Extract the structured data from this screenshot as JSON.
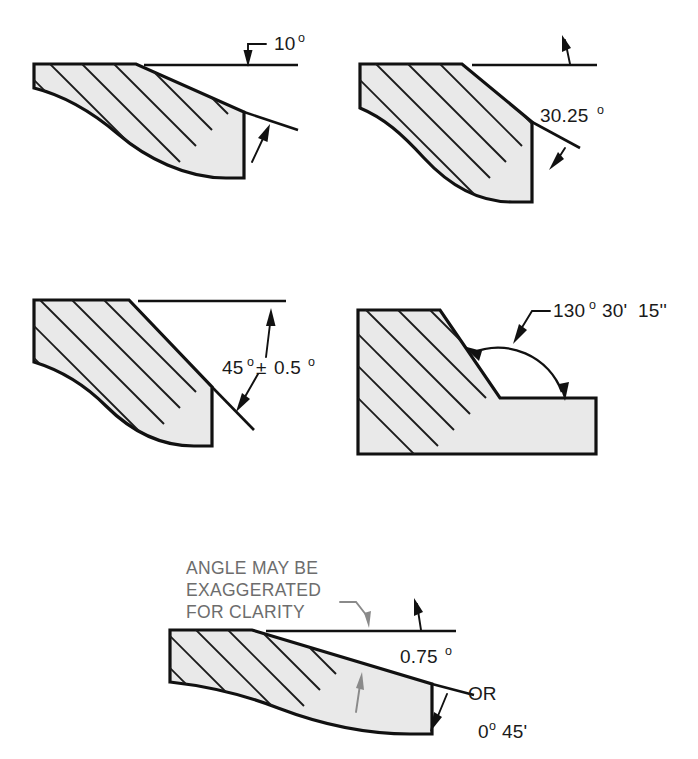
{
  "page": {
    "background_color": "#ffffff",
    "line_color": "#111111",
    "hatch_fill_color": "#e9e9e9",
    "note_color": "#6d6d6d"
  },
  "figures": [
    {
      "id": "fig-10-degrees",
      "name": "ten-degree-chamfer",
      "label": "10",
      "degree_symbol": "o",
      "label_full": "10º",
      "annotation_style": "leader-with-arrow-above-reference-line",
      "arrows": 2,
      "has_break_line": true
    },
    {
      "id": "fig-30-25-degrees",
      "name": "thirty-point-two-five-degree-chamfer",
      "label": "30.25",
      "degree_symbol": "o",
      "label_full": "30.25º",
      "annotation_style": "text-between-two-arrows",
      "arrows": 2,
      "has_break_line": true
    },
    {
      "id": "fig-45-degrees-tolerance",
      "name": "forty-five-degree-chamfer-with-tolerance",
      "label": "45",
      "degree_symbol": "o",
      "tolerance_symbol": "±",
      "tolerance_value": "0.5",
      "label_full": "45º ± 0.5º",
      "annotation_style": "text-on-leader-between-two-arrows",
      "arrows": 2,
      "has_break_line": true
    },
    {
      "id": "fig-130-degrees-arc",
      "name": "one-hundred-thirty-degree-included-angle",
      "label": "130",
      "degree_symbol": "o",
      "minutes": "30'",
      "seconds": "15''",
      "label_full": "130º 30' 15''",
      "annotation_style": "arc-dimension-with-leader",
      "arrows": 2,
      "has_break_line": false
    },
    {
      "id": "fig-075-degrees",
      "name": "point-seven-five-degree-exaggerated-angle",
      "note_lines": [
        "ANGLE MAY BE",
        "EXAGGERATED",
        "FOR CLARITY"
      ],
      "label": "0.75",
      "degree_symbol": "o",
      "label_full": "0.75º",
      "alternative_connector": "OR",
      "alternative_label": "0º 45'",
      "alternative_degrees": "0",
      "alternative_minutes": "45'",
      "annotation_style": "leader-note-with-alternate-notation",
      "arrows": 2,
      "has_break_line": true
    }
  ]
}
